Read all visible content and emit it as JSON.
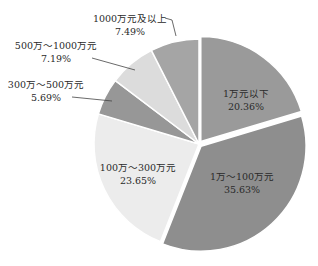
{
  "chart_data": {
    "type": "pie",
    "title": "",
    "categories": [
      "1万元以下",
      "1万～100万元",
      "100万～300万元",
      "300万～500万元",
      "500万～1000万元",
      "1000万元及以上"
    ],
    "values": [
      20.36,
      35.63,
      23.65,
      5.69,
      7.19,
      7.49
    ],
    "value_labels": [
      "20.36%",
      "35.63%",
      "23.65%",
      "5.69%",
      "7.19%",
      "7.49%"
    ],
    "colors": [
      "#9a9a9a",
      "#8e8e8e",
      "#ececec",
      "#979797",
      "#dcdcdc",
      "#a5a5a5"
    ],
    "start_angle_deg": 0,
    "direction": "clockwise",
    "exploded": [
      "1万元以下",
      "1万～100万元"
    ],
    "legend": "none",
    "labels_inside": [
      "1万元以下",
      "1万～100万元",
      "100万～300万元"
    ],
    "labels_outside_with_leader": [
      "300万～500万元",
      "500万～1000万元",
      "1000万元及以上"
    ]
  },
  "labels": [
    {
      "name": "1万元以下",
      "pct": "20.36%"
    },
    {
      "name": "1万～100万元",
      "pct": "35.63%"
    },
    {
      "name": "100万～300万元",
      "pct": "23.65%"
    },
    {
      "name": "300万～500万元",
      "pct": "5.69%"
    },
    {
      "name": "500万～1000万元",
      "pct": "7.19%"
    },
    {
      "name": "1000万元及以上",
      "pct": "7.49%"
    }
  ]
}
